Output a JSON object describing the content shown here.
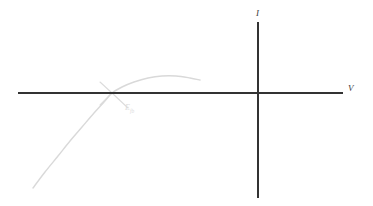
{
  "figure": {
    "background_color": "#ffffff",
    "width": 373,
    "height": 206
  },
  "axes": {
    "color": "#333333",
    "stroke_width": 2,
    "horizontal": {
      "name": "voltage-axis",
      "label": "V",
      "label_position": "right-end",
      "x_start": 18,
      "x_end": 343,
      "y": 93
    },
    "vertical": {
      "name": "current-axis",
      "label": "I",
      "label_position": "top-end",
      "x": 258,
      "y_start": 22,
      "y_end": 198
    },
    "origin": {
      "x": 258,
      "y": 93
    }
  },
  "annotation": {
    "name": "flat-band-potential-label",
    "label_main": "E",
    "label_subscript": "fb",
    "color": "#dcdcdc",
    "leader_lines": [
      {
        "from_x": 112,
        "from_y": 93,
        "to_x": 128,
        "to_y": 108
      },
      {
        "from_x": 112,
        "from_y": 93,
        "to_x": 100,
        "to_y": 105
      },
      {
        "from_x": 112,
        "from_y": 93,
        "to_x": 100,
        "to_y": 82
      }
    ],
    "points_to": {
      "x": 112,
      "y": 93
    }
  },
  "chart_data": {
    "type": "line",
    "title": "",
    "xlabel": "V",
    "ylabel": "I",
    "grid": false,
    "legend": null,
    "series": [
      {
        "name": "iv-curve",
        "color": "#d9d9d9",
        "stroke_width": 1.4,
        "description": "Parabolic photocurrent onset curve rising from lower-left, crossing the voltage axis at the flat-band potential, peaking and levelling off",
        "points": [
          {
            "x": 33,
            "y": 188
          },
          {
            "x": 45,
            "y": 172
          },
          {
            "x": 58,
            "y": 156
          },
          {
            "x": 70,
            "y": 141
          },
          {
            "x": 82,
            "y": 127
          },
          {
            "x": 94,
            "y": 113
          },
          {
            "x": 104,
            "y": 102
          },
          {
            "x": 112,
            "y": 93
          },
          {
            "x": 122,
            "y": 87
          },
          {
            "x": 134,
            "y": 82
          },
          {
            "x": 148,
            "y": 78
          },
          {
            "x": 162,
            "y": 76
          },
          {
            "x": 176,
            "y": 76
          },
          {
            "x": 190,
            "y": 78
          },
          {
            "x": 200,
            "y": 80
          }
        ],
        "x_axis_crossing": 112,
        "peak": {
          "x": 168,
          "y": 76
        }
      }
    ]
  }
}
